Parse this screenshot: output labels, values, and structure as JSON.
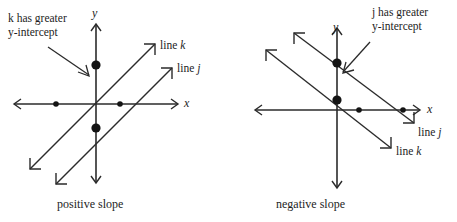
{
  "figure": {
    "background_color": "#ffffff",
    "stroke_color": "#2b2b2b",
    "dot_color": "#141414"
  },
  "panels": [
    {
      "id": "positive-slope-panel",
      "caption": "positive slope",
      "axes": {
        "x_label": "x",
        "y_label": "y"
      },
      "annotation": {
        "line1": "k has greater",
        "line2": "y-intercept",
        "target": "upper-y-intercept-dot"
      },
      "lines": [
        {
          "name": "line k",
          "label": "line k",
          "slope_sign": "positive",
          "y_intercept": "greater",
          "y_intercept_point_size": "large",
          "x_intercept_point_size": "small"
        },
        {
          "name": "line j",
          "label": "line j",
          "slope_sign": "positive",
          "y_intercept": "lesser",
          "y_intercept_point_size": "large",
          "x_intercept_point_size": "small"
        }
      ]
    },
    {
      "id": "negative-slope-panel",
      "caption": "negative slope",
      "axes": {
        "x_label": "x",
        "y_label": "y"
      },
      "annotation": {
        "line1": "j has greater",
        "line2": "y-intercept",
        "target": "upper-y-intercept-dot"
      },
      "lines": [
        {
          "name": "line j",
          "label": "line j",
          "slope_sign": "negative",
          "y_intercept": "greater",
          "y_intercept_point_size": "large",
          "x_intercept_point_size": "small"
        },
        {
          "name": "line k",
          "label": "line k",
          "slope_sign": "negative",
          "y_intercept": "lesser",
          "y_intercept_point_size": "large",
          "x_intercept_point_size": "small"
        }
      ]
    }
  ]
}
